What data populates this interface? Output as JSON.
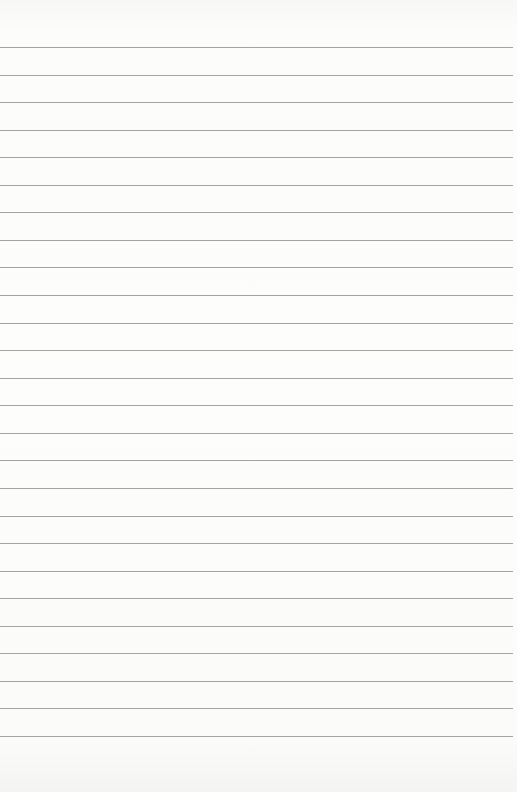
{
  "paper": {
    "type": "lined-paper",
    "background_color": "#fbfbfa",
    "line_color": "#a3a3a3",
    "first_line_y": 47,
    "line_spacing": 27.56,
    "line_count": 26,
    "line_width": 513
  }
}
